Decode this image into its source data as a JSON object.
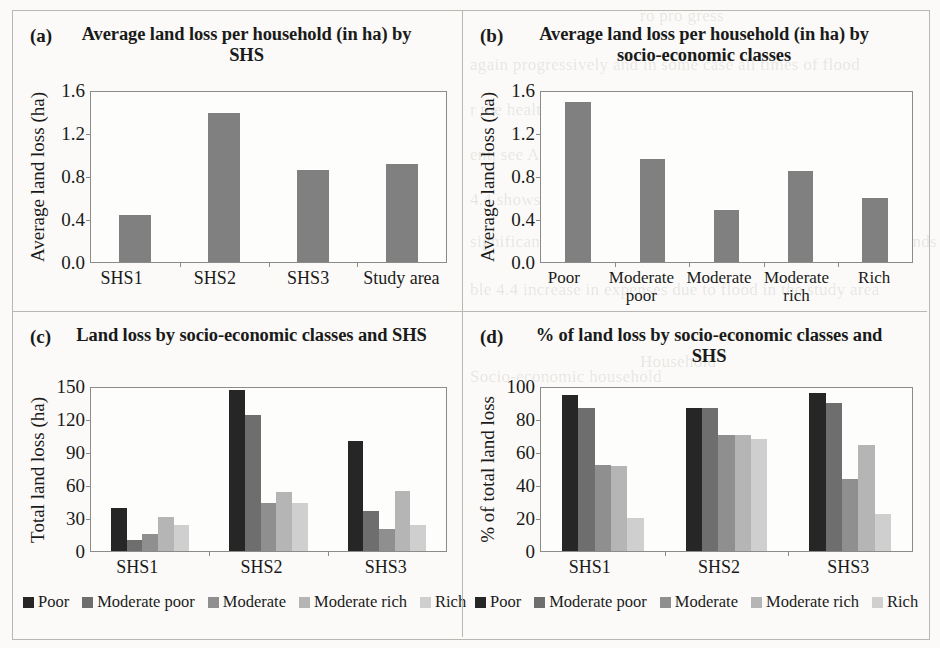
{
  "page": {
    "background_color": "#fbfaf8",
    "panel_border_color": "#b9b7b2",
    "axis_color": "#8d8b87"
  },
  "ghost_text": [
    {
      "text": "ro pro gress",
      "x": 640,
      "y": 6
    },
    {
      "text": "again progressively and in some case all times of flood",
      "x": 470,
      "y": 55
    },
    {
      "text": "r the healthy income club households",
      "x": 470,
      "y": 100
    },
    {
      "text": "ent, see Appendix D) affected by SHS and by socio-economic",
      "x": 470,
      "y": 145
    },
    {
      "text": "4.4 shows the incremental losses incurred by respective class",
      "x": 470,
      "y": 190
    },
    {
      "text": "significant asset for the affected area. Large households and lands",
      "x": 470,
      "y": 232
    },
    {
      "text": "ble 4.4 increase in expenses due to flood in the study area",
      "x": 470,
      "y": 280
    },
    {
      "text": "Socio-economic household",
      "x": 470,
      "y": 367
    },
    {
      "text": "Household",
      "x": 640,
      "y": 352
    }
  ],
  "palette": {
    "poor": "#262626",
    "moderate_poor": "#6e6e6e",
    "moderate": "#8f8f8f",
    "moderate_rich": "#b5b5b5",
    "rich": "#cfcfcf",
    "single_series_bar": "#808080"
  },
  "legend_items": [
    {
      "label": "Poor",
      "color": "#262626"
    },
    {
      "label": "Moderate poor",
      "color": "#6e6e6e"
    },
    {
      "label": "Moderate",
      "color": "#8f8f8f"
    },
    {
      "label": "Moderate rich",
      "color": "#b5b5b5"
    },
    {
      "label": "Rich",
      "color": "#cfcfcf"
    }
  ],
  "panels": {
    "a": {
      "tag": "(a)",
      "title": "Average land loss per household (in ha) by SHS"
    },
    "b": {
      "tag": "(b)",
      "title": "Average land loss per household (in ha) by socio-economic classes"
    },
    "c": {
      "tag": "(c)",
      "title": "Land loss by socio-economic classes and SHS"
    },
    "d": {
      "tag": "(d)",
      "title": "% of land loss by socio-economic classes and SHS"
    }
  },
  "chart_data": [
    {
      "id": "a",
      "type": "bar",
      "title": "Average land loss per household (in ha) by SHS",
      "xlabel": "",
      "ylabel": "Average land loss (ha)",
      "categories": [
        "SHS1",
        "SHS2",
        "SHS3",
        "Study area"
      ],
      "values": [
        0.44,
        1.4,
        0.87,
        0.92
      ],
      "ylim": [
        0.0,
        1.6
      ],
      "yticks": [
        "0.0",
        "0.4",
        "0.8",
        "1.2",
        "1.6"
      ],
      "ytick_values": [
        0.0,
        0.4,
        0.8,
        1.2,
        1.6
      ],
      "grid": false,
      "legend": false,
      "bar_color": "#808080"
    },
    {
      "id": "b",
      "type": "bar",
      "title": "Average land loss per household (in ha) by socio-economic classes",
      "xlabel": "",
      "ylabel": "Average land loss (ha)",
      "categories": [
        "Poor",
        "Moderate poor",
        "Moderate",
        "Moderate rich",
        "Rich"
      ],
      "values": [
        1.51,
        0.97,
        0.49,
        0.86,
        0.6
      ],
      "ylim": [
        0.0,
        1.6
      ],
      "yticks": [
        "0.0",
        "0.4",
        "0.8",
        "1.2",
        "1.6"
      ],
      "ytick_values": [
        0.0,
        0.4,
        0.8,
        1.2,
        1.6
      ],
      "grid": false,
      "legend": false,
      "bar_color": "#808080"
    },
    {
      "id": "c",
      "type": "bar",
      "title": "Land loss by socio-economic classes and SHS",
      "xlabel": "",
      "ylabel": "Total land loss (ha)",
      "categories": [
        "SHS1",
        "SHS2",
        "SHS3"
      ],
      "series": [
        {
          "name": "Poor",
          "color": "#262626",
          "values": [
            40,
            148,
            101
          ]
        },
        {
          "name": "Moderate poor",
          "color": "#6e6e6e",
          "values": [
            10,
            125,
            37
          ]
        },
        {
          "name": "Moderate",
          "color": "#8f8f8f",
          "values": [
            16,
            44,
            20
          ]
        },
        {
          "name": "Moderate rich",
          "color": "#b5b5b5",
          "values": [
            31,
            54,
            55
          ]
        },
        {
          "name": "Rich",
          "color": "#cfcfcf",
          "values": [
            24,
            44,
            24
          ]
        }
      ],
      "ylim": [
        0,
        150
      ],
      "yticks": [
        "0",
        "30",
        "60",
        "90",
        "120",
        "150"
      ],
      "ytick_values": [
        0,
        30,
        60,
        90,
        120,
        150
      ],
      "grid": false,
      "legend": true,
      "legend_position": "bottom"
    },
    {
      "id": "d",
      "type": "bar",
      "title": "% of land loss by socio-economic classes and SHS",
      "xlabel": "",
      "ylabel": "% of total land loss",
      "categories": [
        "SHS1",
        "SHS2",
        "SHS3"
      ],
      "series": [
        {
          "name": "Poor",
          "color": "#262626",
          "values": [
            96,
            88,
            97
          ]
        },
        {
          "name": "Moderate poor",
          "color": "#6e6e6e",
          "values": [
            88,
            88,
            91
          ]
        },
        {
          "name": "Moderate",
          "color": "#8f8f8f",
          "values": [
            53,
            71,
            44
          ]
        },
        {
          "name": "Moderate rich",
          "color": "#b5b5b5",
          "values": [
            52,
            71,
            65
          ]
        },
        {
          "name": "Rich",
          "color": "#cfcfcf",
          "values": [
            20,
            69,
            23
          ]
        }
      ],
      "ylim": [
        0,
        100
      ],
      "yticks": [
        "0",
        "20",
        "40",
        "60",
        "80",
        "100"
      ],
      "ytick_values": [
        0,
        20,
        40,
        60,
        80,
        100
      ],
      "grid": false,
      "legend": true,
      "legend_position": "bottom"
    }
  ]
}
